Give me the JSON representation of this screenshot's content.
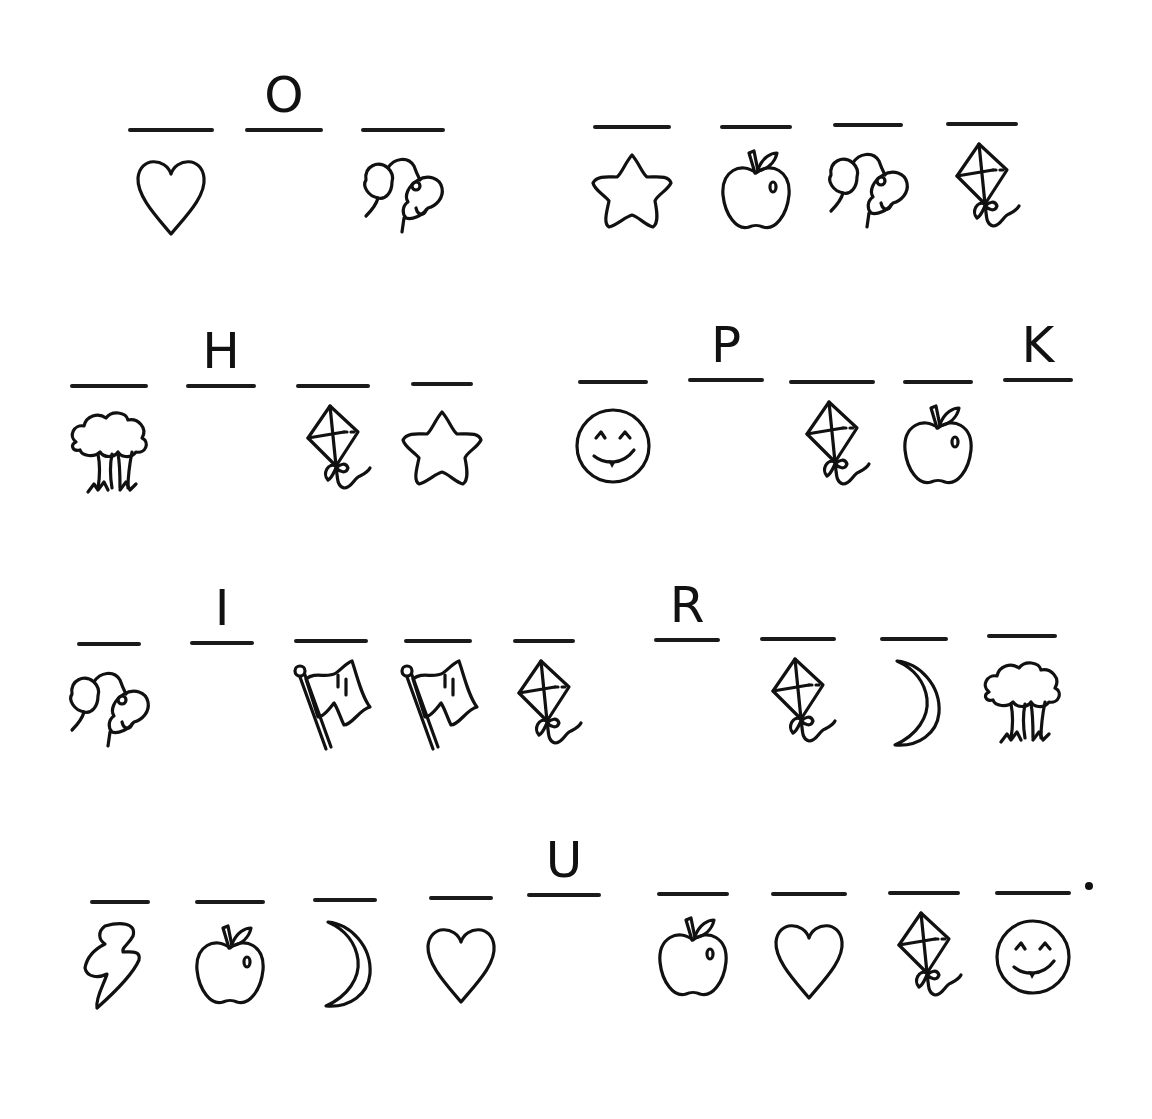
{
  "worksheet": {
    "title": "",
    "rows": [
      {
        "words": [
          {
            "blanks": [
              {
                "letter": "",
                "icon": "heart"
              },
              {
                "letter": "O",
                "icon": ""
              },
              {
                "letter": "",
                "icon": "dog"
              }
            ]
          },
          {
            "blanks": [
              {
                "letter": "",
                "icon": "star"
              },
              {
                "letter": "",
                "icon": "apple"
              },
              {
                "letter": "",
                "icon": "dog"
              },
              {
                "letter": "",
                "icon": "kite"
              }
            ]
          }
        ]
      },
      {
        "words": [
          {
            "blanks": [
              {
                "letter": "",
                "icon": "tree"
              },
              {
                "letter": "H",
                "icon": ""
              },
              {
                "letter": "",
                "icon": "kite"
              },
              {
                "letter": "",
                "icon": "star"
              }
            ]
          },
          {
            "blanks": [
              {
                "letter": "",
                "icon": "smiley"
              },
              {
                "letter": "P",
                "icon": ""
              },
              {
                "letter": "",
                "icon": "kite"
              },
              {
                "letter": "",
                "icon": "apple"
              },
              {
                "letter": "K",
                "icon": ""
              }
            ]
          }
        ]
      },
      {
        "words": [
          {
            "blanks": [
              {
                "letter": "",
                "icon": "dog"
              },
              {
                "letter": "I",
                "icon": ""
              },
              {
                "letter": "",
                "icon": "flag"
              },
              {
                "letter": "",
                "icon": "flag"
              },
              {
                "letter": "",
                "icon": "kite"
              },
              {
                "letter": "R",
                "icon": ""
              },
              {
                "letter": "",
                "icon": "kite"
              },
              {
                "letter": "",
                "icon": "moon"
              },
              {
                "letter": "",
                "icon": "tree"
              }
            ]
          }
        ]
      },
      {
        "words": [
          {
            "blanks": [
              {
                "letter": "",
                "icon": "lightning"
              },
              {
                "letter": "",
                "icon": "apple"
              },
              {
                "letter": "",
                "icon": "moon"
              },
              {
                "letter": "",
                "icon": "heart"
              },
              {
                "letter": "U",
                "icon": ""
              },
              {
                "letter": "",
                "icon": "apple"
              },
              {
                "letter": "",
                "icon": "heart"
              },
              {
                "letter": "",
                "icon": "kite"
              },
              {
                "letter": "",
                "icon": "smiley"
              }
            ]
          }
        ],
        "end_punctuation": "."
      }
    ]
  },
  "slots": [
    {
      "x": 128,
      "y": 128,
      "w": 86,
      "letter": "",
      "icon": "heart"
    },
    {
      "x": 245,
      "y": 128,
      "w": 78,
      "letter": "O",
      "icon": ""
    },
    {
      "x": 361,
      "y": 128,
      "w": 84,
      "letter": "",
      "icon": "dog"
    },
    {
      "x": 593,
      "y": 125,
      "w": 78,
      "letter": "",
      "icon": "star"
    },
    {
      "x": 720,
      "y": 125,
      "w": 72,
      "letter": "",
      "icon": "apple"
    },
    {
      "x": 833,
      "y": 123,
      "w": 70,
      "letter": "",
      "icon": "dog"
    },
    {
      "x": 946,
      "y": 122,
      "w": 72,
      "letter": "",
      "icon": "kite"
    },
    {
      "x": 70,
      "y": 384,
      "w": 78,
      "letter": "",
      "icon": "tree"
    },
    {
      "x": 186,
      "y": 384,
      "w": 70,
      "letter": "H",
      "icon": ""
    },
    {
      "x": 296,
      "y": 384,
      "w": 74,
      "letter": "",
      "icon": "kite"
    },
    {
      "x": 411,
      "y": 382,
      "w": 62,
      "letter": "",
      "icon": "star"
    },
    {
      "x": 578,
      "y": 380,
      "w": 70,
      "letter": "",
      "icon": "smiley"
    },
    {
      "x": 688,
      "y": 378,
      "w": 76,
      "letter": "P",
      "icon": ""
    },
    {
      "x": 789,
      "y": 380,
      "w": 86,
      "letter": "",
      "icon": "kite"
    },
    {
      "x": 903,
      "y": 380,
      "w": 70,
      "letter": "",
      "icon": "apple"
    },
    {
      "x": 1003,
      "y": 378,
      "w": 70,
      "letter": "K",
      "icon": ""
    },
    {
      "x": 77,
      "y": 642,
      "w": 64,
      "letter": "",
      "icon": "dog"
    },
    {
      "x": 190,
      "y": 641,
      "w": 64,
      "letter": "I",
      "icon": ""
    },
    {
      "x": 294,
      "y": 639,
      "w": 74,
      "letter": "",
      "icon": "flag"
    },
    {
      "x": 404,
      "y": 639,
      "w": 68,
      "letter": "",
      "icon": "flag"
    },
    {
      "x": 513,
      "y": 639,
      "w": 62,
      "letter": "",
      "icon": "kite"
    },
    {
      "x": 654,
      "y": 638,
      "w": 66,
      "letter": "R",
      "icon": ""
    },
    {
      "x": 760,
      "y": 637,
      "w": 76,
      "letter": "",
      "icon": "kite"
    },
    {
      "x": 880,
      "y": 637,
      "w": 68,
      "letter": "",
      "icon": "moon"
    },
    {
      "x": 987,
      "y": 634,
      "w": 70,
      "letter": "",
      "icon": "tree"
    },
    {
      "x": 90,
      "y": 900,
      "w": 60,
      "letter": "",
      "icon": "lightning"
    },
    {
      "x": 195,
      "y": 900,
      "w": 70,
      "letter": "",
      "icon": "apple"
    },
    {
      "x": 313,
      "y": 898,
      "w": 64,
      "letter": "",
      "icon": "moon"
    },
    {
      "x": 429,
      "y": 896,
      "w": 64,
      "letter": "",
      "icon": "heart"
    },
    {
      "x": 527,
      "y": 893,
      "w": 74,
      "letter": "U",
      "icon": ""
    },
    {
      "x": 657,
      "y": 892,
      "w": 72,
      "letter": "",
      "icon": "apple"
    },
    {
      "x": 771,
      "y": 892,
      "w": 76,
      "letter": "",
      "icon": "heart"
    },
    {
      "x": 888,
      "y": 891,
      "w": 72,
      "letter": "",
      "icon": "kite"
    },
    {
      "x": 995,
      "y": 891,
      "w": 76,
      "letter": "",
      "icon": "smiley"
    }
  ],
  "end_dot": {
    "x": 1085,
    "y": 882
  }
}
